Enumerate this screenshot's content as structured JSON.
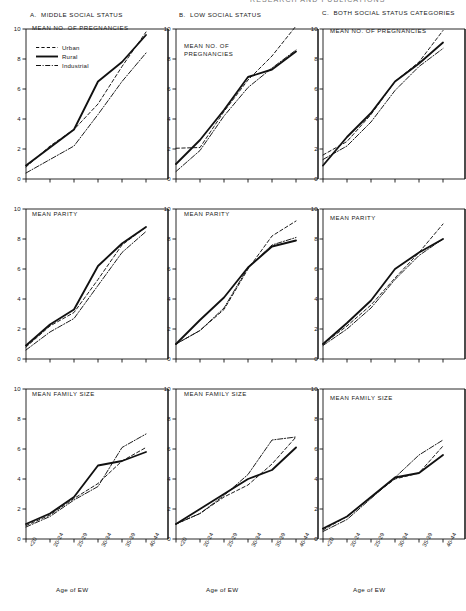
{
  "figure": {
    "cropped_header": "RESEARCH AND PUBLICATIONS",
    "x_axis_caption": "Age of EW",
    "x_categories": [
      "<20",
      "20-24",
      "25-29",
      "30-34",
      "35-39",
      "40-44"
    ],
    "y_ticks": [
      "0",
      "2",
      "4",
      "6",
      "8",
      "10"
    ],
    "y_min": 0,
    "y_max": 10
  },
  "legend": {
    "items": [
      {
        "label": "Urban",
        "style": "dashed"
      },
      {
        "label": "Rural",
        "style": "solid"
      },
      {
        "label": "Industrial",
        "style": "dashdot"
      }
    ]
  },
  "panels": [
    {
      "id": "A",
      "letter": "A",
      "title": "MIDDLE SOCIAL STATUS"
    },
    {
      "id": "B",
      "letter": "B",
      "title": "LOW SOCIAL STATUS"
    },
    {
      "id": "C",
      "letter": "C",
      "title": "BOTH SOCIAL STATUS CATEGORIES"
    }
  ],
  "rows": [
    {
      "id": "pregnancies",
      "label": "MEAN NO. OF PREGNANCIES",
      "label_l1": "MEAN NO. OF",
      "label_l2": "PREGNANCIES"
    },
    {
      "id": "parity",
      "label": "MEAN PARITY",
      "label_l1": "MEAN PARITY",
      "label_l2": ""
    },
    {
      "id": "family",
      "label": "MEAN FAMILY SIZE",
      "label_l1": "MEAN FAMILY SIZE",
      "label_l2": ""
    }
  ],
  "chart_data": [
    {
      "type": "line",
      "title": "A. MIDDLE SOCIAL STATUS — MEAN NO. OF PREGNANCIES",
      "panel": "A",
      "row": "pregnancies",
      "xlabel": "Age of EW",
      "ylabel": "MEAN NO. OF PREGNANCIES",
      "categories": [
        "<20",
        "20-24",
        "25-29",
        "30-34",
        "35-39",
        "40-44"
      ],
      "ylim": [
        0,
        10
      ],
      "grid": false,
      "legend": "inside-top-left",
      "series": [
        {
          "name": "Urban",
          "values": [
            0.8,
            2.2,
            3.3,
            5.0,
            7.5,
            9.8
          ]
        },
        {
          "name": "Rural",
          "values": [
            0.9,
            2.1,
            3.3,
            6.5,
            7.8,
            9.6
          ]
        },
        {
          "name": "Industrial",
          "values": [
            0.4,
            1.3,
            2.2,
            4.3,
            6.5,
            8.4
          ]
        }
      ]
    },
    {
      "type": "line",
      "title": "B. LOW SOCIAL STATUS — MEAN NO. OF PREGNANCIES",
      "panel": "B",
      "row": "pregnancies",
      "xlabel": "Age of EW",
      "ylabel": "MEAN NO. OF PREGNANCIES",
      "categories": [
        "<20",
        "20-24",
        "25-29",
        "30-34",
        "35-39",
        "40-44"
      ],
      "ylim": [
        0,
        10
      ],
      "grid": false,
      "legend": "none",
      "series": [
        {
          "name": "Urban",
          "values": [
            2.05,
            2.1,
            4.5,
            6.6,
            8.2,
            10.2
          ]
        },
        {
          "name": "Rural",
          "values": [
            1.0,
            2.6,
            4.6,
            6.8,
            7.3,
            8.5
          ]
        },
        {
          "name": "Industrial",
          "values": [
            0.5,
            1.9,
            4.2,
            6.1,
            7.4,
            8.6
          ]
        }
      ]
    },
    {
      "type": "line",
      "title": "C. BOTH SOCIAL STATUS CATEGORIES — MEAN NO. OF PREGNANCIES",
      "panel": "C",
      "row": "pregnancies",
      "xlabel": "Age of EW",
      "ylabel": "MEAN NO. OF PREGNANCIES",
      "categories": [
        "<20",
        "20-24",
        "25-29",
        "30-34",
        "35-39",
        "40-44"
      ],
      "ylim": [
        0,
        10
      ],
      "grid": false,
      "legend": "none",
      "series": [
        {
          "name": "Urban",
          "values": [
            1.6,
            2.5,
            4.3,
            6.5,
            7.8,
            9.9
          ]
        },
        {
          "name": "Rural",
          "values": [
            0.9,
            2.8,
            4.4,
            6.5,
            7.7,
            9.1
          ]
        },
        {
          "name": "Industrial",
          "values": [
            1.3,
            2.2,
            3.8,
            5.9,
            7.5,
            8.7
          ]
        }
      ]
    },
    {
      "type": "line",
      "title": "A. MIDDLE SOCIAL STATUS — MEAN PARITY",
      "panel": "A",
      "row": "parity",
      "xlabel": "Age of EW",
      "ylabel": "MEAN PARITY",
      "categories": [
        "<20",
        "20-24",
        "25-29",
        "30-34",
        "35-39",
        "40-44"
      ],
      "ylim": [
        0,
        10
      ],
      "grid": false,
      "legend": "none",
      "series": [
        {
          "name": "Urban",
          "values": [
            0.8,
            2.2,
            3.1,
            5.3,
            7.6,
            8.8
          ]
        },
        {
          "name": "Rural",
          "values": [
            0.9,
            2.3,
            3.3,
            6.2,
            7.7,
            8.8
          ]
        },
        {
          "name": "Industrial",
          "values": [
            0.6,
            1.8,
            2.7,
            4.9,
            7.1,
            8.5
          ]
        }
      ]
    },
    {
      "type": "line",
      "title": "B. LOW SOCIAL STATUS — MEAN PARITY",
      "panel": "B",
      "row": "parity",
      "xlabel": "Age of EW",
      "ylabel": "MEAN PARITY",
      "categories": [
        "<20",
        "20-24",
        "25-29",
        "30-34",
        "35-39",
        "40-44"
      ],
      "ylim": [
        0,
        10
      ],
      "grid": false,
      "legend": "none",
      "series": [
        {
          "name": "Urban",
          "values": [
            1.0,
            1.9,
            3.3,
            6.0,
            8.2,
            9.2
          ]
        },
        {
          "name": "Rural",
          "values": [
            1.0,
            2.6,
            4.1,
            6.1,
            7.5,
            7.9
          ]
        },
        {
          "name": "Industrial",
          "values": [
            1.0,
            1.9,
            3.4,
            6.1,
            7.6,
            8.1
          ]
        }
      ]
    },
    {
      "type": "line",
      "title": "C. BOTH SOCIAL STATUS CATEGORIES — MEAN PARITY",
      "panel": "C",
      "row": "parity",
      "xlabel": "Age of EW",
      "ylabel": "MEAN PARITY",
      "categories": [
        "<20",
        "20-24",
        "25-29",
        "30-34",
        "35-39",
        "40-44"
      ],
      "ylim": [
        0,
        10
      ],
      "grid": false,
      "legend": "none",
      "series": [
        {
          "name": "Urban",
          "values": [
            1.0,
            2.2,
            3.6,
            5.4,
            7.1,
            9.0
          ]
        },
        {
          "name": "Rural",
          "values": [
            1.0,
            2.4,
            3.9,
            6.0,
            7.1,
            8.0
          ]
        },
        {
          "name": "Industrial",
          "values": [
            0.9,
            2.0,
            3.4,
            5.3,
            6.9,
            8.0
          ]
        }
      ]
    },
    {
      "type": "line",
      "title": "A. MIDDLE SOCIAL STATUS — MEAN FAMILY SIZE",
      "panel": "A",
      "row": "family",
      "xlabel": "Age of EW",
      "ylabel": "MEAN FAMILY SIZE",
      "categories": [
        "<20",
        "20-24",
        "25-29",
        "30-34",
        "35-39",
        "40-44"
      ],
      "ylim": [
        0,
        10
      ],
      "grid": false,
      "legend": "none",
      "series": [
        {
          "name": "Urban",
          "values": [
            0.9,
            1.6,
            2.7,
            3.7,
            5.2,
            6.1
          ]
        },
        {
          "name": "Rural",
          "values": [
            1.0,
            1.7,
            2.8,
            4.9,
            5.2,
            5.8
          ]
        },
        {
          "name": "Industrial",
          "values": [
            0.8,
            1.5,
            2.6,
            3.5,
            6.1,
            7.0
          ]
        }
      ]
    },
    {
      "type": "line",
      "title": "B. LOW SOCIAL STATUS — MEAN FAMILY SIZE",
      "panel": "B",
      "row": "family",
      "xlabel": "Age of EW",
      "ylabel": "MEAN FAMILY SIZE",
      "categories": [
        "<20",
        "20-24",
        "25-29",
        "30-34",
        "35-39",
        "40-44"
      ],
      "ylim": [
        0,
        10
      ],
      "grid": false,
      "legend": "none",
      "series": [
        {
          "name": "Urban",
          "values": [
            1.0,
            1.7,
            2.8,
            3.6,
            5.0,
            6.8
          ]
        },
        {
          "name": "Rural",
          "values": [
            1.0,
            2.0,
            3.0,
            4.0,
            4.6,
            6.1
          ]
        },
        {
          "name": "Industrial",
          "values": [
            1.0,
            1.7,
            2.9,
            4.3,
            6.6,
            6.8
          ]
        }
      ]
    },
    {
      "type": "line",
      "title": "C. BOTH SOCIAL STATUS CATEGORIES — MEAN FAMILY SIZE",
      "panel": "C",
      "row": "family",
      "xlabel": "Age of EW",
      "ylabel": "MEAN FAMILY SIZE",
      "categories": [
        "<20",
        "20-24",
        "25-29",
        "30-34",
        "35-39",
        "40-44"
      ],
      "ylim": [
        0,
        10
      ],
      "grid": false,
      "legend": "none",
      "series": [
        {
          "name": "Urban",
          "values": [
            0.6,
            1.5,
            2.8,
            4.0,
            4.4,
            6.2
          ]
        },
        {
          "name": "Rural",
          "values": [
            0.7,
            1.5,
            2.8,
            4.1,
            4.4,
            5.6
          ]
        },
        {
          "name": "Industrial",
          "values": [
            0.5,
            1.3,
            2.7,
            4.1,
            5.6,
            6.6
          ]
        }
      ]
    }
  ]
}
